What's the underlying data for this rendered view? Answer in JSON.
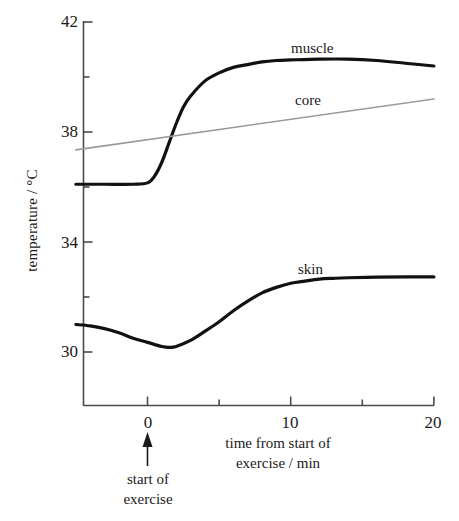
{
  "chart_data": {
    "type": "line",
    "title": "",
    "xlabel": "time from start of exercise / min",
    "xlabel_line1": "time from start of",
    "xlabel_line2": "exercise / min",
    "ylabel": "temperature / °C",
    "xlim": [
      -5,
      20
    ],
    "ylim": [
      27.3,
      42
    ],
    "xticks": [
      0,
      5,
      10,
      15,
      20
    ],
    "xtick_labels": [
      "0",
      "",
      "10",
      "",
      "20"
    ],
    "yticks": [
      30,
      32,
      34,
      36,
      38,
      40,
      42
    ],
    "ytick_labels": [
      "30",
      "",
      "34",
      "",
      "38",
      "",
      "42"
    ],
    "grid": false,
    "legend": "inline-labels",
    "annotations": [
      {
        "name": "start-of-exercise",
        "text_line1": "start of",
        "text_line2": "exercise",
        "x": 0,
        "arrow": "up"
      }
    ],
    "series": [
      {
        "name": "muscle",
        "color": "#111111",
        "width": 3.2,
        "label_x": 13.0,
        "label_y": 41.3,
        "x": [
          -5,
          -3,
          -1,
          0,
          0.5,
          1,
          1.5,
          2,
          2.5,
          3,
          4,
          5,
          6,
          7,
          8,
          9,
          10,
          12,
          14,
          16,
          18,
          20
        ],
        "y": [
          36.1,
          36.1,
          36.1,
          36.15,
          36.4,
          36.9,
          37.6,
          38.3,
          38.9,
          39.3,
          39.85,
          40.15,
          40.35,
          40.45,
          40.55,
          40.6,
          40.62,
          40.65,
          40.65,
          40.6,
          40.5,
          40.4
        ]
      },
      {
        "name": "core",
        "color": "#9a9a9a",
        "width": 1.6,
        "label_x": 11.8,
        "label_y": 39.5,
        "x": [
          -5,
          20
        ],
        "y": [
          37.35,
          39.2
        ]
      },
      {
        "name": "skin",
        "color": "#111111",
        "width": 3.2,
        "label_x": 12.0,
        "label_y": 33.2,
        "x": [
          -5,
          -4,
          -3,
          -2,
          -1,
          0,
          1,
          1.5,
          2,
          3,
          4,
          5,
          6,
          7,
          8,
          9,
          10,
          11,
          12,
          13,
          14,
          16,
          18,
          20
        ],
        "y": [
          31.0,
          30.95,
          30.85,
          30.7,
          30.5,
          30.35,
          30.2,
          30.17,
          30.2,
          30.42,
          30.75,
          31.1,
          31.5,
          31.85,
          32.15,
          32.35,
          32.5,
          32.58,
          32.65,
          32.68,
          32.7,
          32.72,
          32.73,
          32.73
        ]
      }
    ]
  },
  "axes": {
    "y_axis_label": "temperature / °C",
    "y_tick_42": "42",
    "y_tick_38": "38",
    "y_tick_34": "34",
    "y_tick_30": "30",
    "x_tick_0": "0",
    "x_tick_10": "10",
    "x_tick_20": "20"
  },
  "labels": {
    "muscle": "muscle",
    "core": "core",
    "skin": "skin",
    "x_axis_line1": "time from start of",
    "x_axis_line2": "exercise / min",
    "annotation_line1": "start of",
    "annotation_line2": "exercise"
  }
}
